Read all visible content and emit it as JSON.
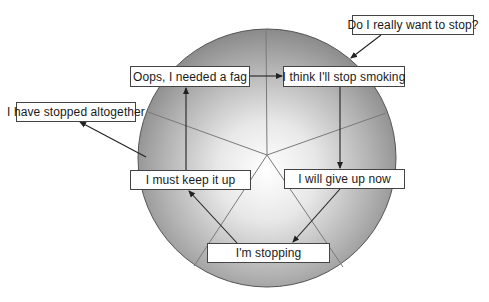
{
  "diagram": {
    "colors": {
      "circle_edge": "#8a8a8a",
      "circle_center": "#ffffff",
      "circle_outline": "#555555",
      "divider": "#7a7a7a",
      "arrow": "#222222",
      "box_border": "#444444",
      "box_fill": "#ffffff"
    },
    "circle": {
      "cx": 267,
      "cy": 158,
      "r": 129
    },
    "nodes": [
      {
        "id": "precontemplation",
        "label": "Do I really want to stop?",
        "x": 352,
        "y": 15,
        "w": 122,
        "h": 20
      },
      {
        "id": "relapse",
        "label": "Oops, I needed a fag",
        "x": 130,
        "y": 66,
        "w": 120,
        "h": 21
      },
      {
        "id": "contemplation",
        "label": "I think I'll stop smoking",
        "x": 283,
        "y": 66,
        "w": 122,
        "h": 21
      },
      {
        "id": "exit",
        "label": "I have stopped altogether",
        "x": 16,
        "y": 102,
        "w": 120,
        "h": 20
      },
      {
        "id": "maintenance",
        "label": "I must keep it up",
        "x": 130,
        "y": 170,
        "w": 121,
        "h": 20
      },
      {
        "id": "preparation",
        "label": "I will give up now",
        "x": 284,
        "y": 169,
        "w": 121,
        "h": 20
      },
      {
        "id": "action",
        "label": "I'm stopping",
        "x": 207,
        "y": 243,
        "w": 123,
        "h": 20
      }
    ],
    "edges": [
      {
        "from": "relapse",
        "to": "contemplation"
      },
      {
        "from": "precontemplation",
        "to": "circle-entry"
      },
      {
        "from": "contemplation",
        "to": "preparation"
      },
      {
        "from": "preparation",
        "to": "action"
      },
      {
        "from": "action",
        "to": "maintenance"
      },
      {
        "from": "maintenance",
        "to": "relapse"
      },
      {
        "from": "circle-exit",
        "to": "exit"
      }
    ]
  }
}
